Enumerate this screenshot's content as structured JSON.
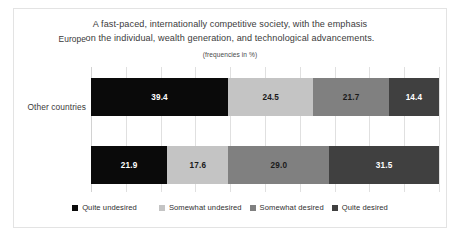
{
  "chart_data": {
    "type": "bar",
    "orientation": "horizontal",
    "stacked": true,
    "stack_mode": "percent",
    "title": "A fast-paced, internationally competitive society, with the emphasis on the individual, wealth generation, and technological advancements.",
    "title_lines": [
      "A fast-paced, internationally competitive society, with the emphasis",
      "on the individual, wealth generation, and technological advancements."
    ],
    "subtitle": "(frequencies in %)",
    "xlabel": "",
    "ylabel": "",
    "xlim": [
      0,
      100
    ],
    "grid": true,
    "legend_position": "bottom",
    "categories": [
      "Europe",
      "Other countries"
    ],
    "series": [
      {
        "name": "Quite undesired",
        "color": "#0a0a0a",
        "label_color": "#ffffff",
        "values": [
          39.4,
          21.9
        ]
      },
      {
        "name": "Somewhat undesired",
        "color": "#c4c4c4",
        "label_color": "#1a1a1a",
        "values": [
          24.5,
          17.6
        ]
      },
      {
        "name": "Somewhat desired",
        "color": "#808080",
        "label_color": "#1a1a1a",
        "values": [
          21.7,
          29.0
        ]
      },
      {
        "name": "Quite desired",
        "color": "#404040",
        "label_color": "#ffffff",
        "values": [
          14.4,
          31.5
        ]
      }
    ],
    "data_labels": [
      [
        "39.4",
        "24.5",
        "21.7",
        "14.4"
      ],
      [
        "21.9",
        "17.6",
        "29.0",
        "31.5"
      ]
    ],
    "gridline_values": [
      0,
      10,
      20,
      30,
      40,
      50,
      60,
      70,
      80,
      90,
      100
    ],
    "colors": {
      "grid": "#e0e0e0",
      "axis": "#d2d2d2",
      "frame_border": "#e3e3e3",
      "background": "#ffffff",
      "title_text": "#3b3b3b"
    }
  }
}
